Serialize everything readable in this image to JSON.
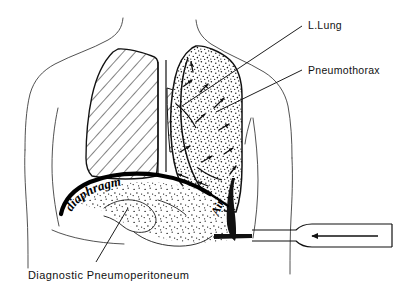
{
  "figure": {
    "background_color": "#ffffff",
    "ink_color": "#111111",
    "style": "black-and-white medical line drawing"
  },
  "labels": {
    "l_lung": "L.Lung",
    "pneumothorax": "Pneumothorax",
    "diaphragm": "diaphragm",
    "air": "Air",
    "caption": "Diagnostic  Pneumoperitoneum"
  },
  "regions": {
    "right_lung": {
      "name": "right-lung-hatched",
      "fill_pattern": "diagonal-hatch",
      "description": "normally aerated right lung shown with diagonal line hatching"
    },
    "left_lung_collapsed": {
      "name": "left-lung-stippled",
      "fill_pattern": "stipple-dots",
      "description": "collapsed left lung and pneumothorax space shown with stippling and air-flow arrows"
    },
    "pneumoperitoneum": {
      "name": "subdiaphragmatic-air",
      "fill_pattern": "stipple-dots",
      "description": "free air beneath the diaphragm"
    },
    "diaphragm_line": {
      "name": "diaphragm-curve",
      "stroke": "#000000",
      "description": "thick black curved diaphragm outline"
    }
  },
  "needle": {
    "name": "insufflation-needle",
    "arrow_direction": "left",
    "description": "needle/cannula entering chest wall, arrow indicating air being introduced"
  },
  "airflow_arrows": {
    "count": 12,
    "description": "small arrows within pneumothorax space indicating air movement"
  }
}
